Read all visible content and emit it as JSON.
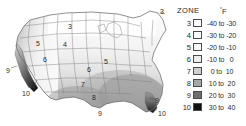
{
  "map": {
    "title": "US climate zone map",
    "background_color": "#ffffff",
    "outline_color": "#6b6b6b",
    "labels": [
      {
        "text": "3",
        "x": 68,
        "y": 23,
        "name": "map-zone-label-3-north-dakota"
      },
      {
        "text": "3",
        "x": 160,
        "y": 8,
        "name": "map-zone-label-3-maine"
      },
      {
        "text": "4",
        "x": 63,
        "y": 41,
        "name": "map-zone-label-4-nebraska"
      },
      {
        "text": "5",
        "x": 36,
        "y": 40,
        "name": "map-zone-label-5-idaho"
      },
      {
        "text": "5",
        "x": 104,
        "y": 58,
        "name": "map-zone-label-5-illinois"
      },
      {
        "text": "6",
        "x": 43,
        "y": 56,
        "name": "map-zone-label-6-nevada"
      },
      {
        "text": "6",
        "x": 87,
        "y": 66,
        "name": "map-zone-label-6-kansas"
      },
      {
        "text": "7",
        "x": 81,
        "y": 81,
        "name": "map-zone-label-7-oklahoma"
      },
      {
        "text": "8",
        "x": 92,
        "y": 94,
        "name": "map-zone-label-8-texas"
      },
      {
        "text": "9",
        "x": 6,
        "y": 67,
        "name": "map-zone-label-9-california-coast"
      },
      {
        "text": "9",
        "x": 98,
        "y": 110,
        "name": "map-zone-label-9-south-texas"
      },
      {
        "text": "9",
        "x": 155,
        "y": 97,
        "name": "map-zone-label-9-florida"
      },
      {
        "text": "10",
        "x": 22,
        "y": 90,
        "name": "map-zone-label-10-southern-california"
      },
      {
        "text": "10",
        "x": 158,
        "y": 110,
        "name": "map-zone-label-10-south-florida"
      }
    ]
  },
  "legend": {
    "title": "ZONE",
    "unit_degree": "°",
    "unit_label": "F",
    "rows": [
      {
        "zone": "3",
        "range": "-40 to -30",
        "color": "#ffffff"
      },
      {
        "zone": "4",
        "range": "-30 to -20",
        "color": "#fdfdfd"
      },
      {
        "zone": "5",
        "range": "-20 to -10",
        "color": "#f7f7f7"
      },
      {
        "zone": "6",
        "range": "-10 to   0",
        "color": "#ededed"
      },
      {
        "zone": "7",
        "range": "  0 to  10",
        "color": "#cfcfcf"
      },
      {
        "zone": "8",
        "range": " 10 to  20",
        "color": "#a8a8a8"
      },
      {
        "zone": "9",
        "range": " 20 to  30",
        "color": "#6e6e6e"
      },
      {
        "zone": "10",
        "range": " 30 to  40",
        "color": "#111111"
      }
    ]
  }
}
